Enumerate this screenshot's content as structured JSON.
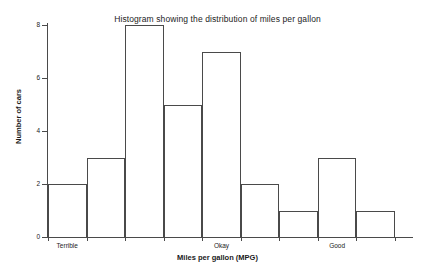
{
  "chart_data": {
    "type": "bar",
    "title": "Histogram showing the distribution of miles per gallon",
    "xlabel": "Miles per gallon (MPG)",
    "ylabel": "Number of cars",
    "categories": [
      "1",
      "2",
      "3",
      "4",
      "5",
      "6",
      "7",
      "8",
      "9"
    ],
    "values": [
      2,
      3,
      8,
      5,
      7,
      2,
      1,
      3,
      1
    ],
    "ylim": [
      0,
      8
    ],
    "yticks": [
      0,
      2,
      4,
      6,
      8
    ],
    "ytick_labels": [
      "0",
      "2",
      "4",
      "6",
      "8"
    ],
    "xtick_labels": [
      "Terrible",
      "Okay",
      "Good"
    ],
    "xtick_bins": [
      1,
      5,
      8
    ],
    "grid": false,
    "legend": null,
    "bar_fill": "#ffffff",
    "bar_edge": "#4a4a4a",
    "background": "#ffffff",
    "text_color": "#232323"
  }
}
